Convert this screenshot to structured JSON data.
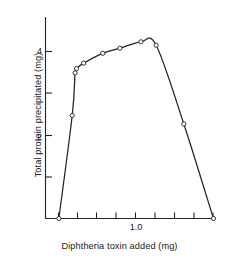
{
  "figure": {
    "kind": "scientific-line-plot",
    "background_color": "#ffffff",
    "ink_color": "#232323"
  },
  "axis_labels": {
    "y_title": "Total protein precipitated (mg)",
    "x_title": "Diphtheria toxin added (mg)"
  },
  "y_ticks": [
    {
      "value": 4,
      "label": "4"
    },
    {
      "value": 3,
      "label": ""
    },
    {
      "value": 2,
      "label": "2"
    },
    {
      "value": 1,
      "label": ""
    }
  ],
  "x_ticks": [
    {
      "value": 0.2,
      "label": ""
    },
    {
      "value": 0.4,
      "label": ""
    },
    {
      "value": 0.6,
      "label": ""
    },
    {
      "value": 0.8,
      "label": ""
    },
    {
      "value": 1.0,
      "label": "1.0"
    },
    {
      "value": 1.2,
      "label": ""
    },
    {
      "value": 1.4,
      "label": ""
    },
    {
      "value": 1.6,
      "label": ""
    },
    {
      "value": 1.8,
      "label": ""
    }
  ],
  "chart_data": {
    "type": "line",
    "title": "",
    "xlabel": "Diphtheria toxin added (mg)",
    "ylabel": "Total protein precipitated (mg)",
    "xlim": [
      0.1,
      1.95
    ],
    "ylim": [
      0,
      4.85
    ],
    "grid": false,
    "legend": "none",
    "marker": "open-circle",
    "line_color": "#232323",
    "marker_face_color": "#ffffff",
    "series": [
      {
        "name": "Total protein precipitated",
        "x": [
          0.24,
          0.38,
          0.41,
          0.425,
          0.5,
          0.7,
          0.88,
          1.1,
          1.26,
          1.55,
          1.86
        ],
        "y": [
          0.0,
          2.42,
          3.42,
          3.52,
          3.65,
          3.88,
          4.0,
          4.15,
          4.07,
          2.22,
          0.0
        ]
      }
    ],
    "annotations": []
  }
}
